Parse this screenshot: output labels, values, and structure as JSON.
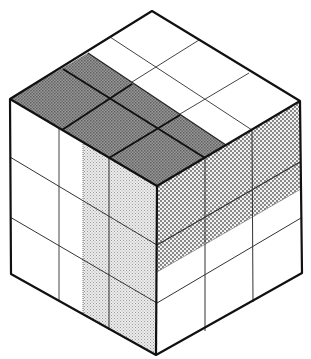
{
  "diagram": {
    "type": "isometric-cube",
    "description": "Cube subdivided into a 3x3x3-style grid with three shaded slabs: a dark band on the top face, a light-dotted vertical slab on the left face, and a dotted horizontal slab on the right face",
    "colors": {
      "background": "#ffffff",
      "outline": "#111111",
      "grid_line": "#444444",
      "top_band_dark": "#8a8a8a",
      "left_slab_light": "#d9d9d9",
      "right_slab_dotted": "#c4c4c4",
      "white_face": "#ffffff"
    },
    "vertices": {
      "top": [
        152,
        11
      ],
      "left": [
        10,
        99
      ],
      "right": [
        300,
        101
      ],
      "center": [
        157,
        186
      ],
      "bottom_left": [
        11,
        274
      ],
      "bottom_right": [
        302,
        273
      ],
      "bottom": [
        156,
        355
      ]
    },
    "faces": [
      {
        "name": "top",
        "shaded_region": "front-left band (dark)"
      },
      {
        "name": "left",
        "shaded_region": "right vertical slab (light dotted)"
      },
      {
        "name": "right",
        "shaded_region": "upper horizontal slab (dotted)"
      }
    ]
  }
}
